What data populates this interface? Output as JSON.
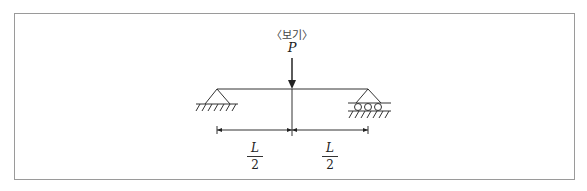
{
  "diagram": {
    "caption": "〈보기〉",
    "load": {
      "label": "P",
      "type": "point-load",
      "position": "midspan"
    },
    "beam": {
      "type": "simply-supported"
    },
    "supports": {
      "left": "pin",
      "right": "roller"
    },
    "dimensions": [
      {
        "numerator": "L",
        "denominator": "2",
        "segment": "left-support-to-load"
      },
      {
        "numerator": "L",
        "denominator": "2",
        "segment": "load-to-right-support"
      }
    ],
    "colors": {
      "line": "#333333",
      "border": "#9a9a9a"
    }
  }
}
